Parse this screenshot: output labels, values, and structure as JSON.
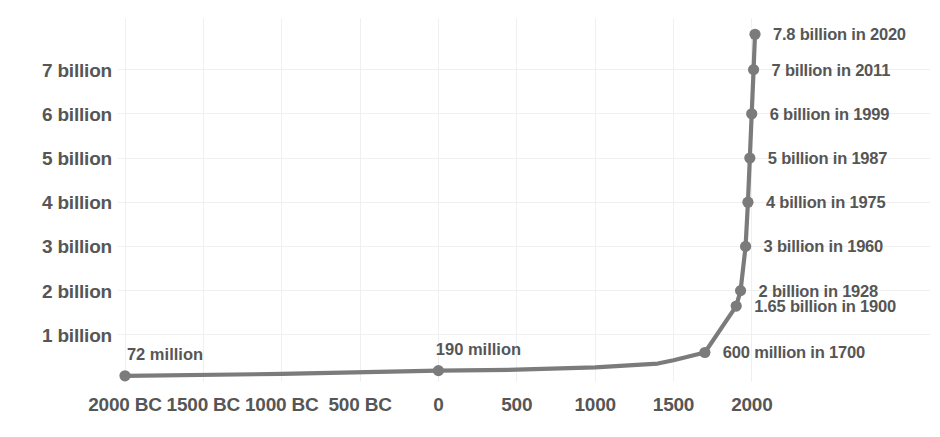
{
  "chart_data": {
    "type": "line",
    "title": "",
    "subtitle": "",
    "xlabel": "",
    "ylabel": "",
    "grid": true,
    "legend": "none",
    "accent_color": "#7b7b7b",
    "text_color": "#565656",
    "grid_color": "#f0f0f0",
    "background": "#ffffff",
    "xlim": [
      -2000,
      2120
    ],
    "ylim": [
      0,
      8.4
    ],
    "x_tick_labels": [
      "2000 BC",
      "1500 BC",
      "1000 BC",
      "500 BC",
      "0",
      "500",
      "1000",
      "1500",
      "2000"
    ],
    "x_tick_values": [
      -2000,
      -1500,
      -1000,
      -500,
      0,
      500,
      1000,
      1500,
      2000
    ],
    "y_tick_labels": [
      "1 billion",
      "2 billion",
      "3 billion",
      "4 billion",
      "5 billion",
      "6 billion",
      "7 billion"
    ],
    "y_tick_values": [
      1,
      2,
      3,
      4,
      5,
      6,
      7
    ],
    "x": [
      -2000,
      -1000,
      0,
      500,
      1000,
      1400,
      1500,
      1700,
      1900,
      1928,
      1960,
      1975,
      1987,
      1999,
      2011,
      2020
    ],
    "values": [
      0.072,
      0.115,
      0.19,
      0.21,
      0.265,
      0.35,
      0.425,
      0.6,
      1.65,
      2.0,
      3.0,
      4.0,
      5.0,
      6.0,
      7.0,
      7.8
    ],
    "points": [
      {
        "x": -2000,
        "y": 0.072,
        "marker": true,
        "label": "72 million",
        "label_pos": "above"
      },
      {
        "x": -1000,
        "y": 0.115,
        "marker": false,
        "label": "",
        "label_pos": ""
      },
      {
        "x": 0,
        "y": 0.19,
        "marker": true,
        "label": "190 million",
        "label_pos": "above"
      },
      {
        "x": 500,
        "y": 0.21,
        "marker": false,
        "label": "",
        "label_pos": ""
      },
      {
        "x": 1000,
        "y": 0.265,
        "marker": false,
        "label": "",
        "label_pos": ""
      },
      {
        "x": 1400,
        "y": 0.35,
        "marker": false,
        "label": "",
        "label_pos": ""
      },
      {
        "x": 1500,
        "y": 0.425,
        "marker": false,
        "label": "",
        "label_pos": ""
      },
      {
        "x": 1700,
        "y": 0.6,
        "marker": true,
        "label": "600 million in 1700",
        "label_pos": "right"
      },
      {
        "x": 1900,
        "y": 1.65,
        "marker": true,
        "label": "1.65 billion in 1900",
        "label_pos": "right"
      },
      {
        "x": 1928,
        "y": 2.0,
        "marker": true,
        "label": "2 billion in 1928",
        "label_pos": "right"
      },
      {
        "x": 1960,
        "y": 3.0,
        "marker": true,
        "label": "3 billion in 1960",
        "label_pos": "right"
      },
      {
        "x": 1975,
        "y": 4.0,
        "marker": true,
        "label": "4 billion in 1975",
        "label_pos": "right"
      },
      {
        "x": 1987,
        "y": 5.0,
        "marker": true,
        "label": "5 billion in 1987",
        "label_pos": "right"
      },
      {
        "x": 1999,
        "y": 6.0,
        "marker": true,
        "label": "6 billion in 1999",
        "label_pos": "right"
      },
      {
        "x": 2011,
        "y": 7.0,
        "marker": true,
        "label": "7 billion in 2011",
        "label_pos": "right"
      },
      {
        "x": 2020,
        "y": 7.8,
        "marker": true,
        "label": "7.8 billion in 2020",
        "label_pos": "right"
      }
    ],
    "right_annotations": [
      "7.8 billion in 2020",
      "7 billion in 2011",
      "6 billion in 1999",
      "5 billion in 1987",
      "4 billion in 1975",
      "3 billion in 1960",
      "2 billion in 1928",
      "1.65 billion in 1900",
      "600 million in 1700"
    ],
    "inline_annotations": [
      "72 million",
      "190 million"
    ]
  }
}
